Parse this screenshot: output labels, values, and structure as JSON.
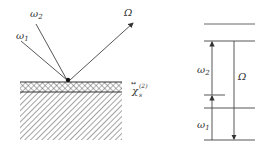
{
  "left_panel": {
    "beams": [
      {
        "label": "ω1",
        "role": "input"
      },
      {
        "label": "ω2",
        "role": "input"
      },
      {
        "label": "Ω",
        "role": "output"
      }
    ],
    "interface_label": {
      "base": "χ",
      "sub": "s",
      "sup": "(2)"
    }
  },
  "right_panel": {
    "labels": {
      "w1": "ω1",
      "w2": "ω2",
      "Omega": "Ω"
    }
  },
  "colors": {
    "line": "#333333",
    "hatch": "#555555"
  }
}
